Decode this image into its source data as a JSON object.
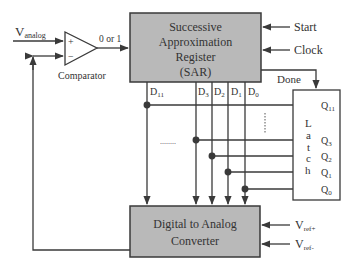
{
  "colors": {
    "block_fill": "#b9b9b9",
    "block_stroke": "#3a3a3a",
    "line": "#3a3a3a",
    "text": "#333333",
    "background": "#ffffff"
  },
  "input": {
    "label_main": "V",
    "label_sub": "analog"
  },
  "comparator": {
    "label": "Comparator",
    "plus": "+",
    "minus": "−",
    "output_label": "0 or 1"
  },
  "sar": {
    "line1": "Successive",
    "line2": "Approximation",
    "line3": "Register",
    "line4": "(SAR)",
    "inputs": [
      "Start",
      "Clock"
    ],
    "done_label": "Done",
    "outputs": [
      {
        "main": "D",
        "sub": "11"
      },
      {
        "main": "D",
        "sub": "3"
      },
      {
        "main": "D",
        "sub": "2"
      },
      {
        "main": "D",
        "sub": "1"
      },
      {
        "main": "D",
        "sub": "0"
      }
    ]
  },
  "latch": {
    "letters": [
      "L",
      "a",
      "t",
      "c",
      "h"
    ],
    "outputs": [
      {
        "main": "Q",
        "sub": "11"
      },
      {
        "main": "Q",
        "sub": "3"
      },
      {
        "main": "Q",
        "sub": "2"
      },
      {
        "main": "Q",
        "sub": "1"
      },
      {
        "main": "Q",
        "sub": "0"
      }
    ]
  },
  "dac": {
    "line1": "Digital to Analog",
    "line2": "Converter",
    "refs": [
      {
        "main": "V",
        "sub": "ref+"
      },
      {
        "main": "V",
        "sub": "ref-"
      }
    ]
  },
  "ellipsis": "........"
}
